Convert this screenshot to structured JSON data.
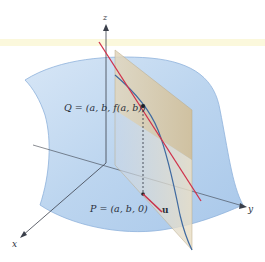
{
  "figure": {
    "type": "3d-surface-directional-derivative",
    "axes": {
      "x_label": "x",
      "y_label": "y",
      "z_label": "z"
    },
    "points": {
      "Q_label": "Q = (a, b, f(a, b))",
      "P_label": "P = (a, b, 0)"
    },
    "vector": {
      "label": "u"
    },
    "colors": {
      "surface": "#b9d3ee",
      "surface_edge": "#8fb3dc",
      "plane": "#d8c9a8",
      "tangent_line": "#d0324b",
      "trace_curve": "#3f6aa0",
      "axis": "#3a3f4a",
      "band": "#fbf8dc"
    }
  }
}
